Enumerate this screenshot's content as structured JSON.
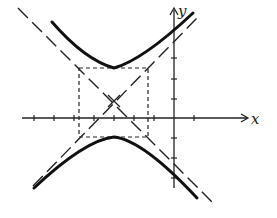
{
  "diagram": {
    "type": "hyperbola-sketch",
    "axes": {
      "x_label": "x",
      "y_label": "y"
    },
    "center": [
      -3,
      1
    ],
    "orientation": "vertical (opens up/down)",
    "elements": [
      "hyperbola branches",
      "asymptotes (dashed)",
      "fundamental rectangle (dashed)"
    ]
  }
}
